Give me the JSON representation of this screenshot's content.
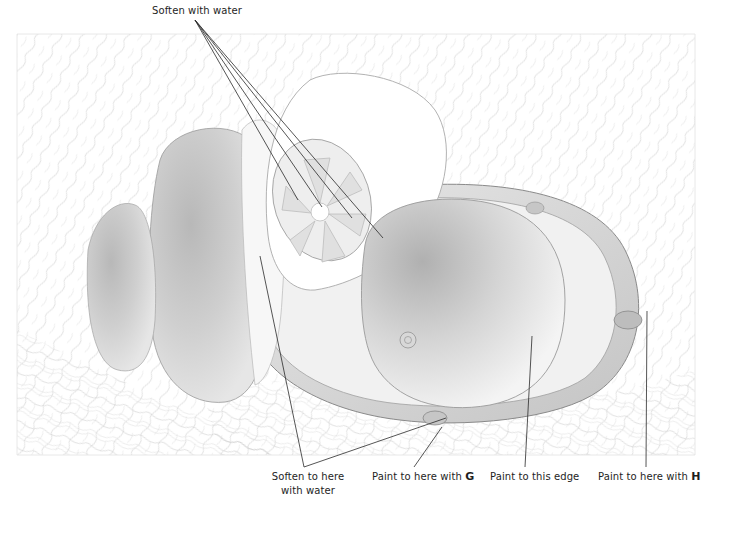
{
  "figure": {
    "palette": {
      "line": "#2a2a2a",
      "wash": "#9a9a9a",
      "wash_light": "#d2d2d2",
      "paper": "#ffffff"
    }
  },
  "annotations": {
    "top": {
      "text": "Soften with water"
    },
    "bottom": [
      {
        "id": "soften-here",
        "line1": "Soften to here",
        "line2": "with water"
      },
      {
        "id": "paint-g",
        "text": "Paint to here with ",
        "key": "G"
      },
      {
        "id": "paint-edge",
        "text": "Paint to this edge"
      },
      {
        "id": "paint-h",
        "text": "Paint to here with ",
        "key": "H"
      }
    ]
  }
}
